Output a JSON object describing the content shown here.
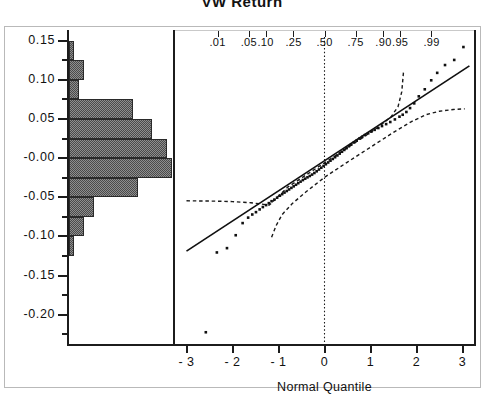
{
  "chart_data": {
    "type": "scatter",
    "title": "VW  Return",
    "subtitle": "",
    "xlabel": "Normal Quantile",
    "ylabel": "",
    "xlim": [
      -3.25,
      3.25
    ],
    "ylim": [
      -0.2375,
      0.1625
    ],
    "grid": false,
    "legend": null,
    "panels": [
      {
        "name": "histogram",
        "orientation": "horizontal",
        "bin_width": 0.025,
        "bins": [
          {
            "lower": 0.125,
            "upper": 0.15,
            "count": 1
          },
          {
            "lower": 0.1,
            "upper": 0.125,
            "count": 3
          },
          {
            "lower": 0.075,
            "upper": 0.1,
            "count": 2
          },
          {
            "lower": 0.05,
            "upper": 0.075,
            "count": 13
          },
          {
            "lower": 0.025,
            "upper": 0.05,
            "count": 17
          },
          {
            "lower": 0.0,
            "upper": 0.025,
            "count": 20
          },
          {
            "lower": -0.025,
            "upper": 0.0,
            "count": 21
          },
          {
            "lower": -0.05,
            "upper": -0.025,
            "count": 14
          },
          {
            "lower": -0.075,
            "upper": -0.05,
            "count": 5
          },
          {
            "lower": -0.1,
            "upper": -0.075,
            "count": 3
          },
          {
            "lower": -0.125,
            "upper": -0.1,
            "count": 1
          },
          {
            "lower": -0.225,
            "upper": -0.2,
            "count": 0
          }
        ]
      },
      {
        "name": "normal-quantile-plot",
        "reference_line": {
          "intercept": -0.0033,
          "slope": 0.0385
        },
        "points": [
          {
            "x": -2.58,
            "y": -0.2225
          },
          {
            "x": -2.34,
            "y": -0.1205
          },
          {
            "x": -2.12,
            "y": -0.115
          },
          {
            "x": -1.93,
            "y": -0.0985
          },
          {
            "x": -1.78,
            "y": -0.083
          },
          {
            "x": -1.66,
            "y": -0.076
          },
          {
            "x": -1.57,
            "y": -0.072
          },
          {
            "x": -1.49,
            "y": -0.069
          },
          {
            "x": -1.41,
            "y": -0.0655
          },
          {
            "x": -1.34,
            "y": -0.0625
          },
          {
            "x": -1.27,
            "y": -0.06
          },
          {
            "x": -1.21,
            "y": -0.0575
          },
          {
            "x": -1.15,
            "y": -0.055
          },
          {
            "x": -1.09,
            "y": -0.053
          },
          {
            "x": -1.03,
            "y": -0.0505
          },
          {
            "x": -0.97,
            "y": -0.048
          },
          {
            "x": -0.92,
            "y": -0.046
          },
          {
            "x": -0.87,
            "y": -0.044
          },
          {
            "x": -0.82,
            "y": -0.042
          },
          {
            "x": -0.77,
            "y": -0.04
          },
          {
            "x": -0.72,
            "y": -0.038
          },
          {
            "x": -0.67,
            "y": -0.036
          },
          {
            "x": -0.62,
            "y": -0.034
          },
          {
            "x": -0.57,
            "y": -0.032
          },
          {
            "x": -0.52,
            "y": -0.03
          },
          {
            "x": -0.47,
            "y": -0.028
          },
          {
            "x": -0.42,
            "y": -0.0262
          },
          {
            "x": -0.37,
            "y": -0.0245
          },
          {
            "x": -0.32,
            "y": -0.0228
          },
          {
            "x": -0.27,
            "y": -0.021
          },
          {
            "x": -0.22,
            "y": -0.019
          },
          {
            "x": -0.17,
            "y": -0.0168
          },
          {
            "x": -0.12,
            "y": -0.0145
          },
          {
            "x": -0.07,
            "y": -0.0122
          },
          {
            "x": -0.02,
            "y": -0.01
          },
          {
            "x": 0.03,
            "y": -0.0078
          },
          {
            "x": 0.08,
            "y": -0.0055
          },
          {
            "x": 0.13,
            "y": -0.0032
          },
          {
            "x": 0.18,
            "y": -0.001
          },
          {
            "x": 0.23,
            "y": 0.0012
          },
          {
            "x": 0.28,
            "y": 0.0035
          },
          {
            "x": 0.33,
            "y": 0.0058
          },
          {
            "x": 0.38,
            "y": 0.0082
          },
          {
            "x": 0.43,
            "y": 0.0105
          },
          {
            "x": 0.48,
            "y": 0.0128
          },
          {
            "x": 0.53,
            "y": 0.0152
          },
          {
            "x": 0.58,
            "y": 0.0175
          },
          {
            "x": 0.64,
            "y": 0.02
          },
          {
            "x": 0.7,
            "y": 0.0225
          },
          {
            "x": 0.76,
            "y": 0.025
          },
          {
            "x": 0.82,
            "y": 0.0272
          },
          {
            "x": 0.88,
            "y": 0.0295
          },
          {
            "x": 0.95,
            "y": 0.0318
          },
          {
            "x": 1.02,
            "y": 0.034
          },
          {
            "x": 1.09,
            "y": 0.0362
          },
          {
            "x": 1.17,
            "y": 0.0385
          },
          {
            "x": 1.25,
            "y": 0.041
          },
          {
            "x": 1.34,
            "y": 0.0435
          },
          {
            "x": 1.43,
            "y": 0.0462
          },
          {
            "x": 1.53,
            "y": 0.0495
          },
          {
            "x": 1.63,
            "y": 0.053
          },
          {
            "x": 1.7,
            "y": 0.0555
          },
          {
            "x": 1.78,
            "y": 0.059
          },
          {
            "x": 1.86,
            "y": 0.064
          },
          {
            "x": 1.95,
            "y": 0.07
          },
          {
            "x": 2.05,
            "y": 0.079
          },
          {
            "x": 2.18,
            "y": 0.088
          },
          {
            "x": 2.32,
            "y": 0.0995
          },
          {
            "x": 2.45,
            "y": 0.109
          },
          {
            "x": 2.62,
            "y": 0.119
          },
          {
            "x": 2.82,
            "y": 0.1255
          },
          {
            "x": 3.02,
            "y": 0.142
          }
        ],
        "confidence_bands": {
          "style": "dashed",
          "upper": [
            {
              "x": -3.0,
              "y": -0.0545
            },
            {
              "x": -2.5,
              "y": -0.0548
            },
            {
              "x": -2.0,
              "y": -0.0555
            },
            {
              "x": -1.6,
              "y": -0.057
            },
            {
              "x": -1.2,
              "y": -0.06
            },
            {
              "x": -0.8,
              "y": -0.037
            },
            {
              "x": -0.4,
              "y": -0.0215
            },
            {
              "x": 0.0,
              "y": -0.006
            },
            {
              "x": 0.4,
              "y": 0.0095
            },
            {
              "x": 0.8,
              "y": 0.025
            },
            {
              "x": 1.2,
              "y": 0.041
            },
            {
              "x": 1.45,
              "y": 0.053
            },
            {
              "x": 1.6,
              "y": 0.066
            },
            {
              "x": 1.68,
              "y": 0.085
            },
            {
              "x": 1.72,
              "y": 0.112
            }
          ],
          "lower": [
            {
              "x": -1.15,
              "y": -0.101
            },
            {
              "x": -1.05,
              "y": -0.086
            },
            {
              "x": -0.92,
              "y": -0.072
            },
            {
              "x": -0.7,
              "y": -0.058
            },
            {
              "x": -0.4,
              "y": -0.043
            },
            {
              "x": 0.0,
              "y": -0.0245
            },
            {
              "x": 0.5,
              "y": -0.005
            },
            {
              "x": 1.0,
              "y": 0.014
            },
            {
              "x": 1.5,
              "y": 0.033
            },
            {
              "x": 1.9,
              "y": 0.047
            },
            {
              "x": 2.2,
              "y": 0.0555
            },
            {
              "x": 2.5,
              "y": 0.06
            },
            {
              "x": 2.8,
              "y": 0.0622
            },
            {
              "x": 3.05,
              "y": 0.063
            }
          ]
        },
        "median_line": {
          "x": 0.0,
          "style": "dotted",
          "label": ".50"
        }
      }
    ],
    "y_axis": {
      "major_ticks": [
        0.15,
        0.1,
        0.05,
        -0.0,
        -0.05,
        -0.1,
        -0.15,
        -0.2
      ],
      "major_labels": [
        "0.15",
        "0.10",
        "0.05",
        "-0.00",
        "-0.05",
        "-0.10",
        "-0.15",
        "-0.20"
      ],
      "minor_ticks": [
        0.125,
        0.075,
        0.025,
        -0.025,
        -0.075,
        -0.125,
        -0.175,
        -0.225
      ]
    },
    "x_axis": {
      "ticks": [
        -3,
        -2,
        -1,
        0,
        1,
        2,
        3
      ],
      "labels": [
        "- 3",
        "- 2",
        "- 1",
        "0",
        "1",
        "2",
        "3"
      ]
    },
    "probability_axis": {
      "labels": [
        ".01",
        ".05",
        ".10",
        ".25",
        ".50",
        ".75",
        ".90",
        ".95",
        ".99"
      ],
      "quantiles": [
        -2.326,
        -1.645,
        -1.282,
        -0.674,
        0.0,
        0.674,
        1.282,
        1.645,
        2.326
      ]
    }
  },
  "colors": {
    "axis": "#1c1c1c",
    "bar_fill": "#8e8e8e",
    "bar_edge": "#2a2a2a",
    "point": "#101010",
    "reference_line": "#101010",
    "band": "#1a1a1a",
    "frame": "#b9b9b9",
    "background": "#ffffff"
  }
}
